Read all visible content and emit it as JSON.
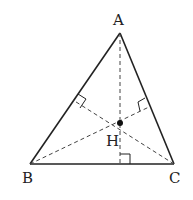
{
  "diagram": {
    "points": {
      "A": {
        "label": "A"
      },
      "B": {
        "label": "B"
      },
      "C": {
        "label": "C"
      },
      "H": {
        "label": "H"
      }
    },
    "sides": [
      "AB",
      "BC",
      "CA"
    ],
    "altitudes": [
      "A-to-BC",
      "B-to-CA",
      "C-to-AB"
    ],
    "right_angle_marks": 3,
    "line_color": "#222222"
  }
}
